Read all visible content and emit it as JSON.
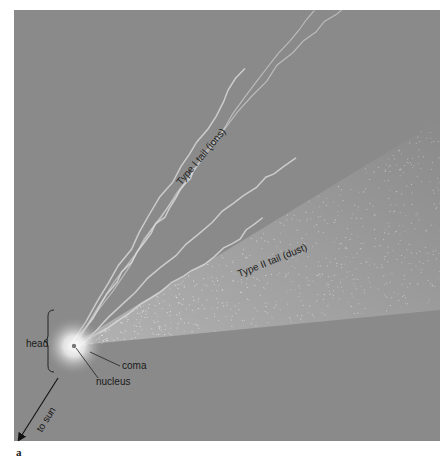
{
  "figure": {
    "panel_letter": "a",
    "background_color": "#8a8a8a",
    "labels": {
      "type1_tail": "Type I tail (ions)",
      "type2_tail": "Type II tail (dust)",
      "head": "head",
      "coma": "coma",
      "nucleus": "nucleus",
      "to_sun": "to sun"
    }
  }
}
